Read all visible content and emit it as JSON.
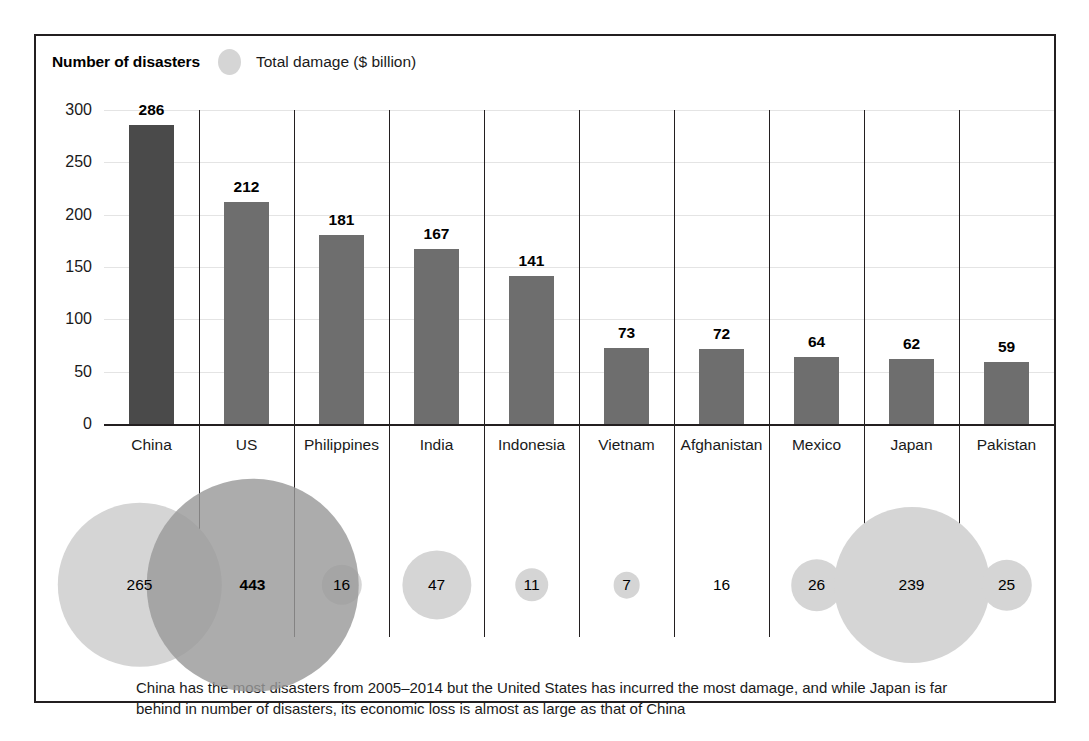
{
  "legend": {
    "bars_label": "Number of disasters",
    "bubble_icon": "circle-icon",
    "bubbles_label": "Total damage ($ billion)",
    "bubble_color": "#d5d5d5"
  },
  "caption": {
    "line1": "China has the most disasters from 2005–2014 but the United States has incurred the most damage, and while",
    "line2": "Japan is far behind in number of disasters, its economic loss is almost as large as that of China"
  },
  "colors": {
    "bar_default": "#6e6e6e",
    "bar_highlight": "#4a4a4a",
    "bubble_light": "#d5d5d5",
    "bubble_dark": "#9a9a9a",
    "axis": "#231f20",
    "grid": "#e4e4e4"
  },
  "chart_data": {
    "type": "bar",
    "title": "",
    "subtitle": "",
    "xlabel": "",
    "ylabel": "Number of disasters",
    "ylim": [
      0,
      300
    ],
    "yticks": [
      "0",
      "50",
      "100",
      "150",
      "200",
      "250",
      "300"
    ],
    "grid": true,
    "legend_position": "top-left",
    "categories": [
      "China",
      "US",
      "Philippines",
      "India",
      "Indonesia",
      "Vietnam",
      "Afghanistan",
      "Mexico",
      "Japan",
      "Pakistan"
    ],
    "series": [
      {
        "name": "Number of disasters",
        "type": "bar",
        "values": [
          286,
          212,
          181,
          167,
          141,
          73,
          72,
          64,
          62,
          59
        ]
      },
      {
        "name": "Total damage ($ billion)",
        "type": "bubble",
        "values": [
          265,
          443,
          16,
          47,
          11,
          7,
          16,
          26,
          239,
          25
        ]
      }
    ],
    "annotations": [
      "China has the most disasters from 2005–2014 but the United States has incurred the most damage, and while Japan is far behind in number of disasters, its economic loss is almost as large as that of China"
    ]
  }
}
